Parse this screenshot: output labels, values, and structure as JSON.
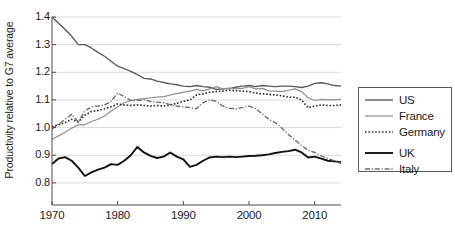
{
  "chart_data": {
    "type": "line",
    "title": "",
    "xlabel": "",
    "ylabel": "Productivity relative to G7 average",
    "xlim": [
      1970,
      2014
    ],
    "ylim": [
      0.72,
      1.4
    ],
    "grid": "horizontal",
    "legend_position": "right-outside",
    "xticks": [
      1970,
      1980,
      1990,
      2000,
      2010
    ],
    "yticks": [
      0.8,
      0.9,
      1.0,
      1.1,
      1.2,
      1.3,
      1.4
    ],
    "ytick_labels": [
      "0.8",
      "0.9",
      "1.0",
      "1.1",
      "1.2",
      "1.3",
      "1.4"
    ],
    "xtick_labels": [
      "1970",
      "1980",
      "1990",
      "2000",
      "2010"
    ],
    "x": [
      1970,
      1971,
      1972,
      1973,
      1974,
      1975,
      1976,
      1977,
      1978,
      1979,
      1980,
      1981,
      1982,
      1983,
      1984,
      1985,
      1986,
      1987,
      1988,
      1989,
      1990,
      1991,
      1992,
      1993,
      1994,
      1995,
      1996,
      1997,
      1998,
      1999,
      2000,
      2001,
      2002,
      2003,
      2004,
      2005,
      2006,
      2007,
      2008,
      2009,
      2010,
      2011,
      2012,
      2013,
      2014
    ],
    "series": [
      {
        "name": "US",
        "color": "#5a5a5a",
        "style": "solid",
        "width": 1.4,
        "values": [
          1.4,
          1.377,
          1.355,
          1.33,
          1.3,
          1.3,
          1.288,
          1.272,
          1.258,
          1.24,
          1.222,
          1.213,
          1.203,
          1.192,
          1.178,
          1.176,
          1.168,
          1.163,
          1.158,
          1.155,
          1.15,
          1.148,
          1.152,
          1.148,
          1.146,
          1.138,
          1.14,
          1.141,
          1.146,
          1.15,
          1.152,
          1.148,
          1.152,
          1.15,
          1.148,
          1.15,
          1.15,
          1.148,
          1.145,
          1.15,
          1.16,
          1.162,
          1.158,
          1.152,
          1.15
        ]
      },
      {
        "name": "France",
        "color": "#8f8f8f",
        "style": "solid",
        "width": 1.2,
        "values": [
          0.958,
          0.97,
          0.983,
          0.998,
          1.01,
          1.01,
          1.022,
          1.03,
          1.042,
          1.06,
          1.075,
          1.09,
          1.098,
          1.102,
          1.105,
          1.108,
          1.11,
          1.112,
          1.118,
          1.123,
          1.128,
          1.132,
          1.138,
          1.133,
          1.14,
          1.148,
          1.14,
          1.143,
          1.14,
          1.142,
          1.148,
          1.14,
          1.142,
          1.133,
          1.132,
          1.13,
          1.135,
          1.14,
          1.13,
          1.108,
          1.098,
          1.102,
          1.1,
          1.1,
          1.102
        ]
      },
      {
        "name": "Germany",
        "color": "#2a2a2a",
        "style": "dotted",
        "width": 1.6,
        "values": [
          1.003,
          1.01,
          1.018,
          1.03,
          1.02,
          1.045,
          1.058,
          1.062,
          1.068,
          1.075,
          1.085,
          1.082,
          1.08,
          1.082,
          1.08,
          1.078,
          1.08,
          1.078,
          1.082,
          1.088,
          1.095,
          1.1,
          1.118,
          1.122,
          1.128,
          1.13,
          1.132,
          1.135,
          1.133,
          1.132,
          1.13,
          1.125,
          1.122,
          1.12,
          1.118,
          1.115,
          1.11,
          1.11,
          1.1,
          1.072,
          1.078,
          1.082,
          1.08,
          1.08,
          1.082
        ]
      },
      {
        "name": "UK",
        "color": "#111111",
        "style": "solid",
        "width": 1.9,
        "values": [
          0.868,
          0.888,
          0.893,
          0.88,
          0.855,
          0.825,
          0.838,
          0.848,
          0.855,
          0.868,
          0.865,
          0.88,
          0.9,
          0.93,
          0.91,
          0.898,
          0.89,
          0.895,
          0.91,
          0.895,
          0.885,
          0.858,
          0.865,
          0.88,
          0.892,
          0.895,
          0.893,
          0.895,
          0.893,
          0.895,
          0.897,
          0.898,
          0.9,
          0.903,
          0.908,
          0.912,
          0.915,
          0.92,
          0.91,
          0.892,
          0.895,
          0.888,
          0.88,
          0.878,
          0.875
        ]
      },
      {
        "name": "Italy",
        "color": "#6b6b6b",
        "style": "dashdot",
        "width": 1.4,
        "values": [
          0.995,
          1.012,
          1.03,
          1.048,
          1.02,
          1.06,
          1.075,
          1.078,
          1.082,
          1.095,
          1.125,
          1.112,
          1.098,
          1.098,
          1.1,
          1.095,
          1.092,
          1.09,
          1.083,
          1.078,
          1.075,
          1.072,
          1.068,
          1.09,
          1.1,
          1.095,
          1.078,
          1.07,
          1.068,
          1.072,
          1.078,
          1.068,
          1.05,
          1.03,
          1.018,
          0.998,
          0.975,
          0.955,
          0.935,
          0.918,
          0.91,
          0.898,
          0.888,
          0.88,
          0.87
        ]
      }
    ]
  },
  "legend": {
    "items": [
      {
        "label": "US"
      },
      {
        "label": "France"
      },
      {
        "label": "Germany"
      },
      {
        "label": "UK"
      },
      {
        "label": "Italy"
      }
    ]
  },
  "colors": {
    "axis": "#4d4d4d",
    "grid": "#d9d9d9",
    "background": "#ffffff"
  }
}
